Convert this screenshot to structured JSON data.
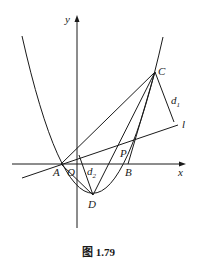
{
  "figure": {
    "caption": "图 1.79",
    "axes": {
      "x_label": "x",
      "y_label": "y",
      "origin_label": "O"
    },
    "points": {
      "A": "A",
      "B": "B",
      "C": "C",
      "D": "D",
      "P": "P"
    },
    "line_label": "l",
    "distances": {
      "d1": {
        "base": "d",
        "sub": "1"
      },
      "d2": {
        "base": "d",
        "sub": "2"
      }
    }
  }
}
